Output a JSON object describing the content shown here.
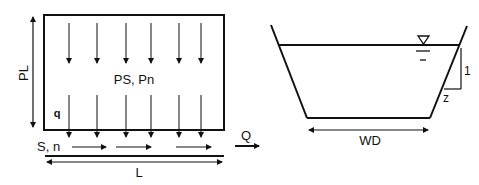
{
  "left_diagram": {
    "title": "Plane flow area",
    "labels": {
      "plane_length": "PL",
      "slope_roughness_plane": "PS, Pn",
      "lateral_inflow": "q",
      "channel_slope_roughness": "S, n",
      "channel_length": "L",
      "discharge": "Q"
    },
    "rainfall_arrow_count": 6
  },
  "right_diagram": {
    "title": "Trapezoidal channel cross-section",
    "labels": {
      "bottom_width": "WD",
      "side_slope_vertical": "1",
      "side_slope_horizontal": "z"
    },
    "water_surface_symbol": "water-surface-triangle"
  }
}
